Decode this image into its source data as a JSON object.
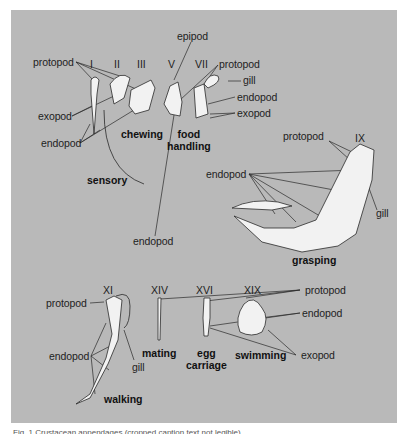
{
  "figure": {
    "background_color": "#b9b9b9",
    "page_color": "#ffffff",
    "caption": "Fig. 1 Crustacean appendages (cropped caption text not legible)"
  },
  "segments": {
    "I": "I",
    "II": "II",
    "III": "III",
    "V": "V",
    "VII": "VII",
    "IX": "IX",
    "XI": "XI",
    "XIV": "XIV",
    "XVI": "XVI",
    "XIX": "XIX"
  },
  "functions": {
    "sensory": "sensory",
    "chewing": "chewing",
    "food_handling_1": "food",
    "food_handling_2": "handling",
    "grasping": "grasping",
    "walking": "walking",
    "mating": "mating",
    "egg_carriage_1": "egg",
    "egg_carriage_2": "carriage",
    "swimming": "swimming"
  },
  "labels": {
    "top_left": {
      "protopod": "protopod",
      "exopod": "exopod",
      "endopod": "endopod"
    },
    "top_middle": {
      "epipod": "epipod",
      "endopod": "endopod"
    },
    "top_right": {
      "protopod": "protopod",
      "gill": "gill",
      "endopod": "endopod",
      "exopod": "exopod"
    },
    "grasping": {
      "protopod": "protopod",
      "endopod": "endopod",
      "gill": "gill"
    },
    "walking": {
      "protopod": "protopod",
      "endopod": "endopod",
      "gill": "gill"
    },
    "bottom_right": {
      "protopod": "protopod",
      "endopod": "endopod",
      "exopod": "exopod"
    }
  }
}
